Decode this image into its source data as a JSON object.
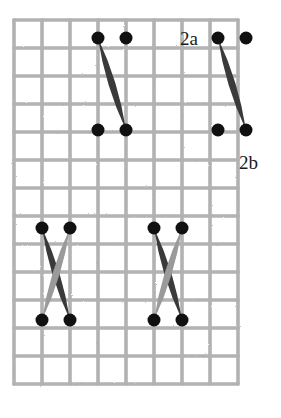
{
  "figure": {
    "background_color": "#ffffff",
    "grid": {
      "line_color": "#b2b2b2",
      "line_width": 3.6,
      "x_start": 14,
      "y_start": 20,
      "cell_size": 28,
      "columns": 9,
      "rows": 14,
      "width": 254,
      "height": 376
    },
    "colors": {
      "dot": "#111111",
      "bond_dark": "#3a3a3a",
      "bond_light": "#9a9a9a",
      "label_text": "#1a1a1a"
    },
    "labels": [
      {
        "id": "2a",
        "text": "2a",
        "x": 180,
        "y": 29
      },
      {
        "id": "2b",
        "text": "2b",
        "x": 239,
        "y": 153
      }
    ],
    "dots": [
      {
        "id": "dot-tl-a",
        "x": 98,
        "y": 38,
        "r": 6.5
      },
      {
        "id": "dot-tl-b",
        "x": 126,
        "y": 38,
        "r": 6.5
      },
      {
        "id": "dot-tl-c",
        "x": 98,
        "y": 130,
        "r": 6.5
      },
      {
        "id": "dot-tl-d",
        "x": 126,
        "y": 130,
        "r": 6.5
      },
      {
        "id": "dot-tr-a",
        "x": 218,
        "y": 38,
        "r": 6.5
      },
      {
        "id": "dot-tr-b",
        "x": 246,
        "y": 38,
        "r": 6.5
      },
      {
        "id": "dot-tr-c",
        "x": 218,
        "y": 130,
        "r": 6.5
      },
      {
        "id": "dot-tr-d",
        "x": 246,
        "y": 130,
        "r": 6.5
      },
      {
        "id": "dot-bl-a",
        "x": 42,
        "y": 228,
        "r": 6.5
      },
      {
        "id": "dot-bl-b",
        "x": 70,
        "y": 228,
        "r": 6.5
      },
      {
        "id": "dot-bl-c",
        "x": 42,
        "y": 320,
        "r": 6.5
      },
      {
        "id": "dot-bl-d",
        "x": 70,
        "y": 320,
        "r": 6.5
      },
      {
        "id": "dot-br-a",
        "x": 154,
        "y": 228,
        "r": 6.5
      },
      {
        "id": "dot-br-b",
        "x": 182,
        "y": 228,
        "r": 6.5
      },
      {
        "id": "dot-br-c",
        "x": 154,
        "y": 320,
        "r": 6.5
      },
      {
        "id": "dot-br-d",
        "x": 182,
        "y": 320,
        "r": 6.5
      }
    ],
    "bonds": [
      {
        "id": "bond-top-left",
        "x1": 98,
        "y1": 38,
        "x2": 126,
        "y2": 130,
        "shade": "dark",
        "max_width": 7
      },
      {
        "id": "bond-top-right",
        "x1": 218,
        "y1": 38,
        "x2": 246,
        "y2": 130,
        "shade": "dark",
        "max_width": 7
      },
      {
        "id": "bond-left-x-dark",
        "x1": 42,
        "y1": 228,
        "x2": 70,
        "y2": 320,
        "shade": "dark",
        "max_width": 7
      },
      {
        "id": "bond-left-x-light",
        "x1": 70,
        "y1": 228,
        "x2": 42,
        "y2": 320,
        "shade": "light",
        "max_width": 7
      },
      {
        "id": "bond-right-x-dark",
        "x1": 154,
        "y1": 228,
        "x2": 182,
        "y2": 320,
        "shade": "dark",
        "max_width": 7
      },
      {
        "id": "bond-right-x-light",
        "x1": 182,
        "y1": 228,
        "x2": 154,
        "y2": 320,
        "shade": "light",
        "max_width": 7
      }
    ]
  }
}
